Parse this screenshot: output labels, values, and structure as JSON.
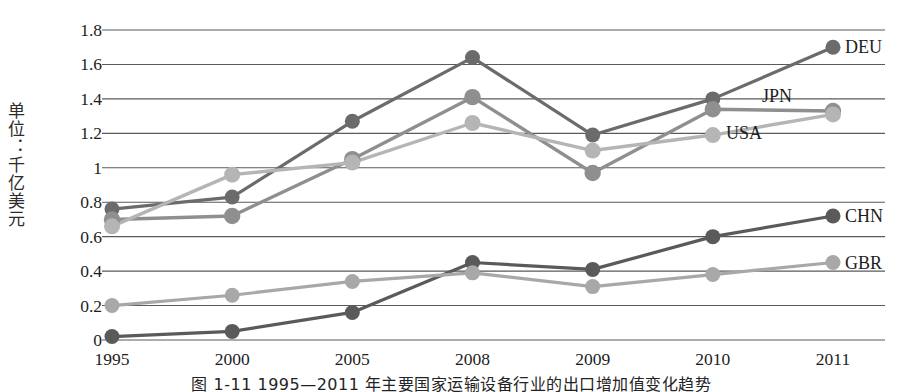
{
  "axis": {
    "y_label": "单位：千亿美元",
    "y_ticks": [
      "1.8",
      "1.6",
      "1.4",
      "1.2",
      "1",
      "0.8",
      "0.6",
      "0.4",
      "0.2",
      "0"
    ],
    "y_tick_values": [
      1.8,
      1.6,
      1.4,
      1.2,
      1.0,
      0.8,
      0.6,
      0.4,
      0.2,
      0
    ],
    "x_ticks": [
      "1995",
      "2000",
      "2005",
      "2008",
      "2009",
      "2010",
      "2011"
    ]
  },
  "series_labels": {
    "deu": "DEU",
    "jpn": "JPN",
    "usa": "USA",
    "chn": "CHN",
    "gbr": "GBR"
  },
  "caption": "图 1-11  1995—2011 年主要国家运输设备行业的出口增加值变化趋势",
  "colors": {
    "deu": "#6b6b6b",
    "jpn": "#8f8f8f",
    "usa": "#b5b5b5",
    "chn": "#5a5a5a",
    "gbr": "#a8a8a8",
    "grid": "#5a5a5a",
    "text": "#1d1d1d"
  },
  "chart_data": {
    "type": "line",
    "title": "",
    "xlabel": "",
    "ylabel": "单位：千亿美元",
    "categories": [
      "1995",
      "2000",
      "2005",
      "2008",
      "2009",
      "2010",
      "2011"
    ],
    "ylim": [
      0,
      1.8
    ],
    "xlim_note": "categorical, evenly spaced",
    "grid": true,
    "grid_axis": "y",
    "legend_position": "right-inline-labels",
    "series": [
      {
        "name": "DEU",
        "values": [
          0.76,
          0.83,
          1.27,
          1.64,
          1.19,
          1.4,
          1.7
        ]
      },
      {
        "name": "JPN",
        "values": [
          0.7,
          0.72,
          1.05,
          1.41,
          0.97,
          1.34,
          1.33
        ]
      },
      {
        "name": "USA",
        "values": [
          0.66,
          0.96,
          1.03,
          1.26,
          1.1,
          1.19,
          1.31
        ]
      },
      {
        "name": "CHN",
        "values": [
          0.02,
          0.05,
          0.16,
          0.45,
          0.41,
          0.6,
          0.72
        ]
      },
      {
        "name": "GBR",
        "values": [
          0.2,
          0.26,
          0.34,
          0.39,
          0.31,
          0.38,
          0.45
        ]
      }
    ],
    "annotations": [
      {
        "text": "DEU",
        "at_category": "2011",
        "value": 1.7
      },
      {
        "text": "JPN",
        "at_category": "2011",
        "value": 1.33
      },
      {
        "text": "USA",
        "at_category": "2011",
        "value": 1.31
      },
      {
        "text": "CHN",
        "at_category": "2011",
        "value": 0.72
      },
      {
        "text": "GBR",
        "at_category": "2011",
        "value": 0.45
      }
    ]
  }
}
